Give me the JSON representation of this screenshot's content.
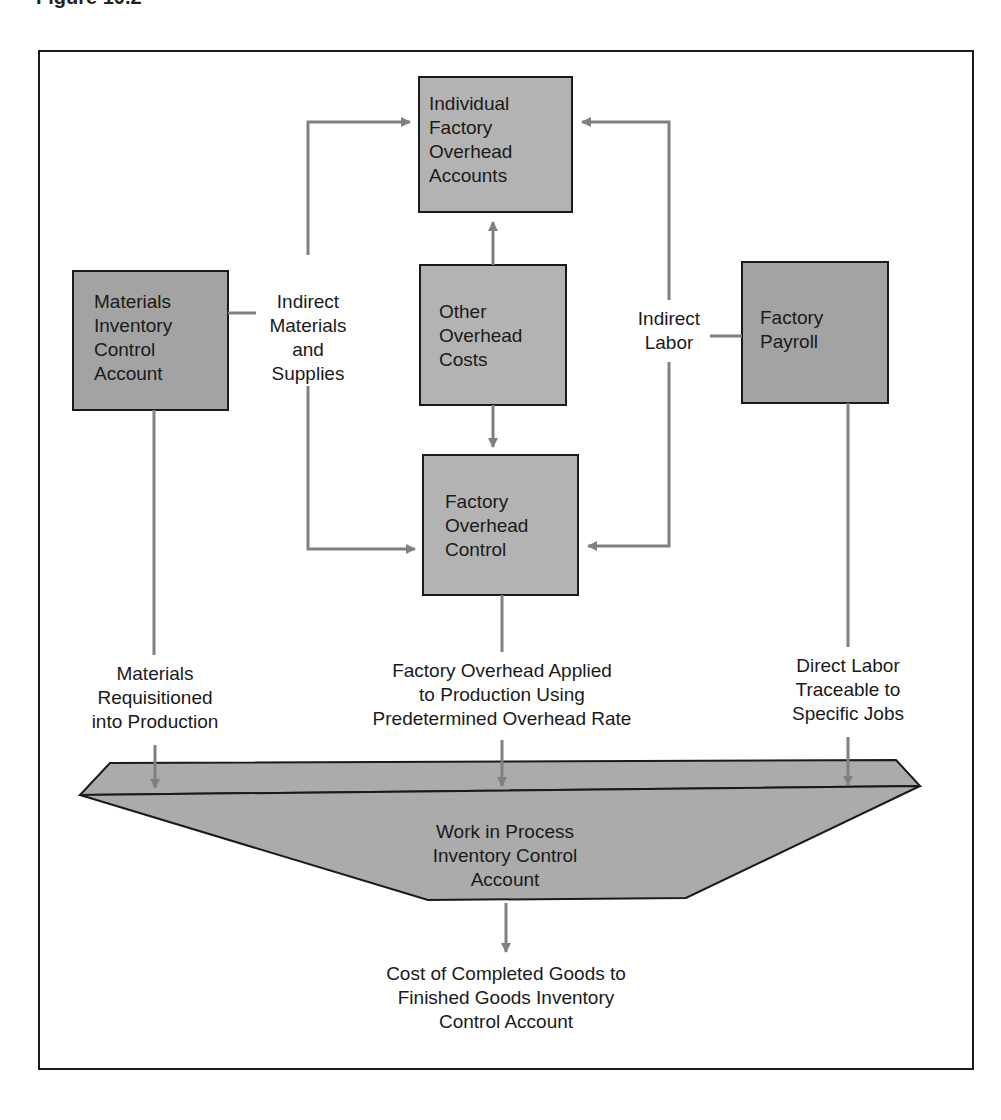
{
  "caption": "Figure 10.2",
  "nodes": {
    "individual_overhead": [
      "Individual",
      "Factory",
      "Overhead",
      "Accounts"
    ],
    "materials_inventory": [
      "Materials",
      "Inventory",
      "Control",
      "Account"
    ],
    "other_overhead": [
      "Other",
      "Overhead",
      "Costs"
    ],
    "factory_payroll": [
      "Factory",
      "Payroll"
    ],
    "overhead_control": [
      "Factory",
      "Overhead",
      "Control"
    ],
    "wip": [
      "Work in Process",
      "Inventory Control",
      "Account"
    ]
  },
  "edge_labels": {
    "indirect_materials": [
      "Indirect",
      "Materials",
      "and",
      "Supplies"
    ],
    "indirect_labor": [
      "Indirect",
      "Labor"
    ],
    "materials_requisitioned": [
      "Materials",
      "Requisitioned",
      "into Production"
    ],
    "overhead_applied": [
      "Factory Overhead Applied",
      "to Production Using",
      "Predetermined Overhead Rate"
    ],
    "direct_labor": [
      "Direct Labor",
      "Traceable to",
      "Specific Jobs"
    ],
    "completed_goods": [
      "Cost of Completed Goods to",
      "Finished Goods Inventory",
      "Control Account"
    ]
  },
  "colors": {
    "box_fill": "#b3b3b3",
    "box_dark_fill": "#a3a3a3",
    "connector": "#808080",
    "border": "#1a1a1a"
  }
}
